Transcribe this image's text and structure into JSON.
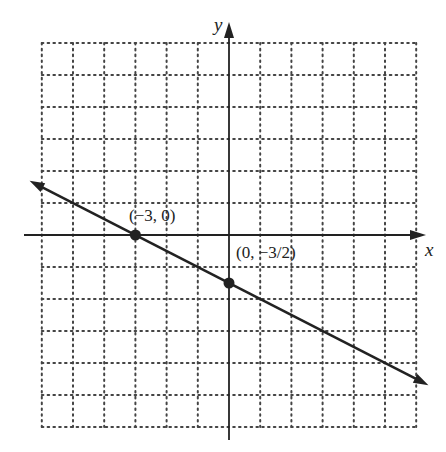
{
  "chart_data": {
    "type": "line",
    "title": "",
    "xlabel": "x",
    "ylabel": "y",
    "xlim": [
      -6,
      6
    ],
    "ylim": [
      -6,
      6
    ],
    "grid": true,
    "grid_style": "dotted",
    "series": [
      {
        "name": "line",
        "equation": "y = -x/2 - 3/2",
        "x": [
          -6,
          6
        ],
        "y": [
          1.5,
          -4.5
        ],
        "arrows": "both"
      }
    ],
    "points": [
      {
        "x": -3,
        "y": 0,
        "label": "(−3, 0)"
      },
      {
        "x": 0,
        "y": -1.5,
        "label": "(0, −3/2)"
      }
    ]
  },
  "labels": {
    "x_axis": "x",
    "y_axis": "y",
    "point1": "(−3, 0)",
    "point2": "(0, −3/2)"
  },
  "colors": {
    "ink": "#222222",
    "grid": "#444444"
  }
}
